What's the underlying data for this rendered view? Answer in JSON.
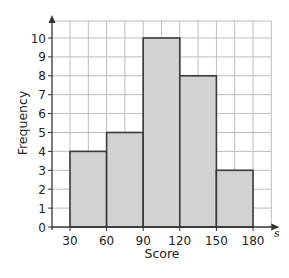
{
  "chart_data": {
    "type": "histogram",
    "title": "",
    "xlabel": "Score",
    "ylabel": "Frequency",
    "x_variable": "s",
    "bins": [
      {
        "from": 30,
        "to": 60,
        "frequency": 4
      },
      {
        "from": 60,
        "to": 90,
        "frequency": 5
      },
      {
        "from": 90,
        "to": 120,
        "frequency": 10
      },
      {
        "from": 120,
        "to": 150,
        "frequency": 8
      },
      {
        "from": 150,
        "to": 180,
        "frequency": 3
      }
    ],
    "categories": [
      "30-60",
      "60-90",
      "90-120",
      "120-150",
      "150-180"
    ],
    "values": [
      4,
      5,
      10,
      8,
      3
    ],
    "x_ticks": [
      30,
      60,
      90,
      120,
      150,
      180
    ],
    "y_ticks": [
      0,
      1,
      2,
      3,
      4,
      5,
      6,
      7,
      8,
      9,
      10
    ],
    "xlim": [
      15,
      195
    ],
    "ylim": [
      0,
      10.9
    ],
    "grid": true,
    "grid_x_step": 15,
    "grid_y_step": 1,
    "legend": null,
    "colors": {
      "bar_fill": "#d2d2d2",
      "bar_stroke": "#3a3a3a",
      "grid": "#bdbdbd",
      "axis": "#333333"
    }
  }
}
